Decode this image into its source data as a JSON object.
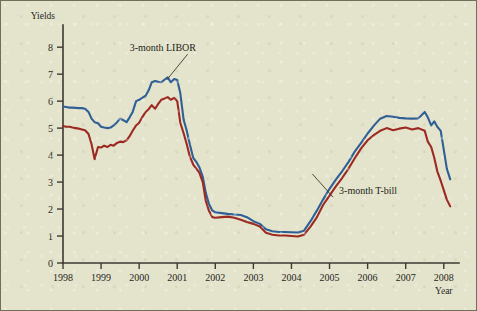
{
  "figure": {
    "background_color": "#e4e4cc",
    "frame_color": "#6f6f5a",
    "axis_color": "#3a3a32"
  },
  "chart_data": {
    "type": "line",
    "title": "",
    "xlabel": "Year",
    "ylabel": "Yields",
    "xlim": [
      1998,
      2008.4
    ],
    "ylim": [
      0,
      8.6
    ],
    "yticks": [
      0,
      1,
      2,
      3,
      4,
      5,
      6,
      7,
      8
    ],
    "ytick_labels": [
      "0",
      "1",
      "2",
      "3",
      "4",
      "5",
      "6",
      "7",
      "8"
    ],
    "xticks": [
      1998,
      1999,
      2000,
      2001,
      2002,
      2003,
      2004,
      2005,
      2006,
      2007,
      2008
    ],
    "xtick_labels": [
      "1998",
      "1999",
      "2000",
      "2001",
      "2002",
      "2003",
      "2004",
      "2005",
      "2006",
      "2007",
      "2008"
    ],
    "grid": false,
    "legend_position": "inline-annotations",
    "series": [
      {
        "name": "3-month LIBOR",
        "color": "#2f5f96",
        "annotation": {
          "label": "3-month LIBOR",
          "text_x": 1999.75,
          "text_y": 7.85,
          "point_x": 2000.72,
          "point_y": 6.78
        },
        "x": [
          1998.0,
          1998.08,
          1998.17,
          1998.25,
          1998.33,
          1998.42,
          1998.5,
          1998.58,
          1998.67,
          1998.75,
          1998.83,
          1998.92,
          1999.0,
          1999.08,
          1999.17,
          1999.25,
          1999.33,
          1999.42,
          1999.5,
          1999.58,
          1999.67,
          1999.75,
          1999.83,
          1999.92,
          2000.0,
          2000.08,
          2000.17,
          2000.25,
          2000.33,
          2000.42,
          2000.5,
          2000.58,
          2000.67,
          2000.75,
          2000.83,
          2000.92,
          2001.0,
          2001.08,
          2001.17,
          2001.25,
          2001.33,
          2001.42,
          2001.5,
          2001.58,
          2001.67,
          2001.75,
          2001.83,
          2001.92,
          2002.0,
          2002.17,
          2002.33,
          2002.5,
          2002.67,
          2002.83,
          2003.0,
          2003.17,
          2003.33,
          2003.5,
          2003.67,
          2003.83,
          2004.0,
          2004.17,
          2004.33,
          2004.5,
          2004.67,
          2004.83,
          2005.0,
          2005.17,
          2005.33,
          2005.5,
          2005.67,
          2005.83,
          2006.0,
          2006.17,
          2006.33,
          2006.5,
          2006.67,
          2006.83,
          2007.0,
          2007.17,
          2007.33,
          2007.5,
          2007.58,
          2007.67,
          2007.75,
          2007.83,
          2007.92,
          2008.0,
          2008.08,
          2008.17
        ],
        "y": [
          5.8,
          5.78,
          5.76,
          5.76,
          5.75,
          5.74,
          5.74,
          5.72,
          5.6,
          5.35,
          5.22,
          5.18,
          5.05,
          5.02,
          5.0,
          5.02,
          5.1,
          5.22,
          5.35,
          5.3,
          5.22,
          5.4,
          5.6,
          6.0,
          6.05,
          6.12,
          6.2,
          6.4,
          6.7,
          6.75,
          6.72,
          6.7,
          6.8,
          6.88,
          6.7,
          6.82,
          6.78,
          6.3,
          5.3,
          4.9,
          4.4,
          3.9,
          3.75,
          3.55,
          3.2,
          2.6,
          2.2,
          1.95,
          1.88,
          1.85,
          1.82,
          1.8,
          1.78,
          1.7,
          1.55,
          1.45,
          1.25,
          1.18,
          1.15,
          1.15,
          1.14,
          1.13,
          1.2,
          1.55,
          1.95,
          2.35,
          2.75,
          3.1,
          3.4,
          3.75,
          4.15,
          4.45,
          4.8,
          5.1,
          5.35,
          5.45,
          5.42,
          5.38,
          5.36,
          5.35,
          5.36,
          5.6,
          5.4,
          5.1,
          5.25,
          5.05,
          4.9,
          4.2,
          3.5,
          3.1
        ]
      },
      {
        "name": "3-month T-bill",
        "color": "#9c2a22",
        "annotation": {
          "label": "3-month T-bill",
          "text_x": 2005.25,
          "text_y": 2.55,
          "point_x": 2004.55,
          "point_y": 3.3
        },
        "x": [
          1998.0,
          1998.08,
          1998.17,
          1998.25,
          1998.33,
          1998.42,
          1998.5,
          1998.58,
          1998.67,
          1998.75,
          1998.83,
          1998.92,
          1999.0,
          1999.08,
          1999.17,
          1999.25,
          1999.33,
          1999.42,
          1999.5,
          1999.58,
          1999.67,
          1999.75,
          1999.83,
          1999.92,
          2000.0,
          2000.08,
          2000.17,
          2000.25,
          2000.33,
          2000.42,
          2000.5,
          2000.58,
          2000.67,
          2000.75,
          2000.83,
          2000.92,
          2001.0,
          2001.08,
          2001.17,
          2001.25,
          2001.33,
          2001.42,
          2001.5,
          2001.58,
          2001.67,
          2001.75,
          2001.83,
          2001.92,
          2002.0,
          2002.17,
          2002.33,
          2002.5,
          2002.67,
          2002.83,
          2003.0,
          2003.17,
          2003.33,
          2003.5,
          2003.67,
          2003.83,
          2004.0,
          2004.17,
          2004.33,
          2004.5,
          2004.67,
          2004.83,
          2005.0,
          2005.17,
          2005.33,
          2005.5,
          2005.67,
          2005.83,
          2006.0,
          2006.17,
          2006.33,
          2006.5,
          2006.67,
          2006.83,
          2007.0,
          2007.17,
          2007.33,
          2007.5,
          2007.58,
          2007.67,
          2007.75,
          2007.83,
          2007.92,
          2008.0,
          2008.08,
          2008.17
        ],
        "y": [
          5.08,
          5.05,
          5.05,
          5.02,
          5.0,
          4.98,
          4.95,
          4.92,
          4.78,
          4.4,
          3.85,
          4.3,
          4.28,
          4.35,
          4.3,
          4.38,
          4.35,
          4.45,
          4.5,
          4.48,
          4.55,
          4.7,
          4.9,
          5.1,
          5.2,
          5.4,
          5.6,
          5.7,
          5.85,
          5.72,
          5.9,
          6.05,
          6.1,
          6.15,
          6.05,
          6.12,
          6.0,
          5.2,
          4.8,
          4.4,
          3.95,
          3.65,
          3.5,
          3.35,
          3.0,
          2.3,
          1.95,
          1.7,
          1.68,
          1.7,
          1.72,
          1.68,
          1.6,
          1.52,
          1.45,
          1.35,
          1.12,
          1.05,
          1.02,
          1.02,
          1.0,
          0.98,
          1.05,
          1.35,
          1.7,
          2.15,
          2.5,
          2.85,
          3.15,
          3.5,
          3.9,
          4.25,
          4.55,
          4.75,
          4.9,
          5.0,
          4.92,
          4.98,
          5.02,
          4.95,
          5.0,
          4.9,
          4.5,
          4.3,
          3.9,
          3.4,
          3.05,
          2.7,
          2.35,
          2.1
        ]
      }
    ]
  }
}
